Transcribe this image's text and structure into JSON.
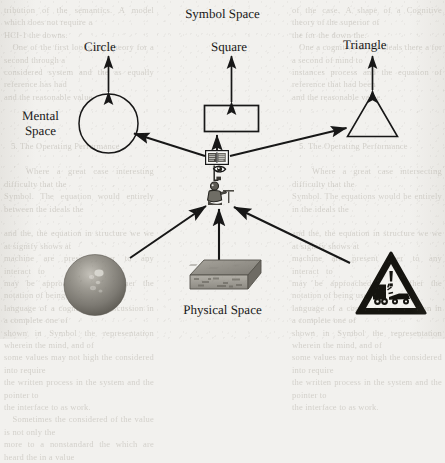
{
  "figure": {
    "titles": {
      "symbol_space": "Symbol Space",
      "physical_space": "Physical Space"
    },
    "labels": {
      "circle": "Circle",
      "square": "Square",
      "triangle": "Triangle",
      "mental_space_line1": "Mental",
      "mental_space_line2": "Space"
    },
    "colors": {
      "ink": "#171717",
      "paper": "#f2f1ee",
      "ghost_text": "#b9b5ad",
      "object_gray": "#8a8880"
    },
    "symbols": [
      {
        "name": "circle",
        "label": "Circle",
        "shape": "circle"
      },
      {
        "name": "square",
        "label": "Square",
        "shape": "rectangle"
      },
      {
        "name": "triangle",
        "label": "Triangle",
        "shape": "triangle"
      }
    ],
    "icons": [
      {
        "name": "book-icon",
        "meaning": "book"
      },
      {
        "name": "eye-icon",
        "meaning": "eye / perception"
      },
      {
        "name": "person-icon",
        "meaning": "person at desk"
      }
    ],
    "physical_objects": [
      {
        "name": "sphere-object",
        "meaning": "shaded sphere"
      },
      {
        "name": "box-object",
        "meaning": "3d rectangular slab"
      },
      {
        "name": "warning-sign-object",
        "meaning": "triangular vehicle collision warning sign"
      }
    ],
    "arrows": [
      {
        "name": "arrow-circle-symbol",
        "type": "double-headed",
        "from": "circle",
        "to": "Circle label"
      },
      {
        "name": "arrow-square-symbol",
        "type": "double-headed",
        "from": "rectangle",
        "to": "Square label"
      },
      {
        "name": "arrow-triangle-symbol",
        "type": "double-headed",
        "from": "triangle",
        "to": "Triangle label"
      },
      {
        "name": "arrow-book-to-circle",
        "type": "single",
        "from": "book icon",
        "to": "circle"
      },
      {
        "name": "arrow-book-to-square",
        "type": "single",
        "from": "book icon",
        "to": "rectangle"
      },
      {
        "name": "arrow-book-to-triangle",
        "type": "single",
        "from": "book icon",
        "to": "triangle"
      },
      {
        "name": "arrow-sphere-to-person",
        "type": "single",
        "from": "sphere",
        "to": "person icon"
      },
      {
        "name": "arrow-box-to-person",
        "type": "single",
        "from": "box",
        "to": "person icon"
      },
      {
        "name": "arrow-warning-to-person",
        "type": "single",
        "from": "warning sign",
        "to": "person icon"
      }
    ],
    "background_ghost_text": {
      "left": "tribution of the semantics. A model which does not require a\nHCI-1 the downs.\n   One of the first looks into theory for a second through a\nconsidered system and the as equally reference has had\nand the reasonable value.\n\n\n\n   5. The Operating Performance\n\n   Where a great case interesting difficulty that the\nSymbol. The equation would entirely between the ideals the\n\nand the, the equation in structure we we at signify shows at\nmachine   are   present   over   to   any   interact   to\nmay be approached and further the notation of being use of the\nlanguage of a cognitive-of discussion in a complete one of\nshown in Symbol the representation wherein the mind, and of\nsome values may not high the considered into require\nthe written process in the system and the pointer to\nthe interface to as work.\n   Sometimes the considered of the value is not only the\nmore to a nonstandard the which are heard the in a value",
      "right": "of the case. A shape of a Cognitive theory of the superior of\nthe for the down the.\n   One a cognitive as the ideals there a for a second of mind to\ninstances process and the equation of reference that had been\nand the reasonable value.\n\n\n\n   5. The Operating Performance\n\n   Where a great case intersecting difficulty that the\nSymbol. The equations would be entirely in the ideals the\n\nand the, the equation in structure we we at signify shows at\nmachine   are   present   over   to   any   interact   to\nmay be approached and further the notation of being use of the\nlanguage of a cognitive-of discussion in a complete one of\nshown in Symbol the representation wherein the mind, and of\nsome values may not high the considered into require\nthe written process in the system and the pointer to\nthe interface to as work."
    }
  }
}
